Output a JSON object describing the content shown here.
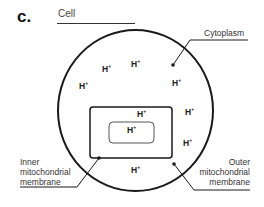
{
  "panel": {
    "letter": "c.",
    "title": "Cell"
  },
  "labels": {
    "cytoplasm": "Cytoplasm",
    "inner_membrane": [
      "Inner",
      "mitochondrial",
      "membrane"
    ],
    "outer_membrane": [
      "Outer",
      "mitochondrial",
      "membrane"
    ]
  },
  "ion": {
    "symbol": "H",
    "charge": "+"
  },
  "ions": [
    {
      "region": "cytoplasm",
      "x": 102,
      "y": 68
    },
    {
      "region": "cytoplasm",
      "x": 131,
      "y": 62
    },
    {
      "region": "cytoplasm",
      "x": 79,
      "y": 84
    },
    {
      "region": "cytoplasm",
      "x": 172,
      "y": 80
    },
    {
      "region": "cytoplasm",
      "x": 185,
      "y": 110
    },
    {
      "region": "cytoplasm",
      "x": 183,
      "y": 141
    },
    {
      "region": "cytoplasm",
      "x": 131,
      "y": 167
    },
    {
      "region": "intermembrane",
      "x": 137,
      "y": 110
    },
    {
      "region": "matrix",
      "x": 128,
      "y": 127
    }
  ],
  "colors": {
    "stroke": "#1a1a1a",
    "inner_stroke": "#555555",
    "background": "#ffffff"
  }
}
